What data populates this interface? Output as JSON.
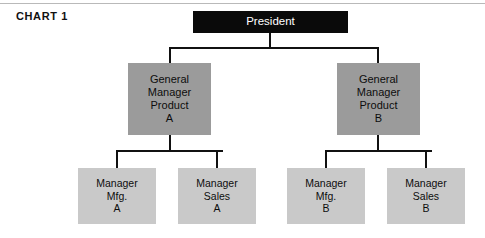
{
  "page": {
    "chart_label": "CHART 1",
    "background_color": "#ffffff"
  },
  "colors": {
    "president_fill": "#0a0a0a",
    "president_text": "#ffffff",
    "general_manager_fill": "#9b9b9b",
    "manager_fill": "#c9c9c9",
    "node_text": "#0d0d0d",
    "connector": "#111111"
  },
  "chart_data": {
    "type": "diagram",
    "title": "CHART 1",
    "subtype": "organizational-hierarchy",
    "levels": 3,
    "nodes": [
      {
        "id": "president",
        "level": 0,
        "lines": [
          "President"
        ],
        "fill": "#0a0a0a",
        "text_color": "#ffffff"
      },
      {
        "id": "gm-product-a",
        "level": 1,
        "lines": [
          "General",
          "Manager",
          "Product",
          "A"
        ],
        "fill": "#9b9b9b",
        "parent": "president"
      },
      {
        "id": "gm-product-b",
        "level": 1,
        "lines": [
          "General",
          "Manager",
          "Product",
          "B"
        ],
        "fill": "#9b9b9b",
        "parent": "president"
      },
      {
        "id": "mgr-mfg-a",
        "level": 2,
        "lines": [
          "Manager",
          "Mfg.",
          "A"
        ],
        "fill": "#c9c9c9",
        "parent": "gm-product-a"
      },
      {
        "id": "mgr-sales-a",
        "level": 2,
        "lines": [
          "Manager",
          "Sales",
          "A"
        ],
        "fill": "#c9c9c9",
        "parent": "gm-product-a"
      },
      {
        "id": "mgr-mfg-b",
        "level": 2,
        "lines": [
          "Manager",
          "Mfg.",
          "B"
        ],
        "fill": "#c9c9c9",
        "parent": "gm-product-b"
      },
      {
        "id": "mgr-sales-b",
        "level": 2,
        "lines": [
          "Manager",
          "Sales",
          "B"
        ],
        "fill": "#c9c9c9",
        "parent": "gm-product-b"
      }
    ],
    "edges": [
      {
        "from": "president",
        "to": "gm-product-a"
      },
      {
        "from": "president",
        "to": "gm-product-b"
      },
      {
        "from": "gm-product-a",
        "to": "mgr-mfg-a"
      },
      {
        "from": "gm-product-a",
        "to": "mgr-sales-a"
      },
      {
        "from": "gm-product-b",
        "to": "mgr-mfg-b"
      },
      {
        "from": "gm-product-b",
        "to": "mgr-sales-b"
      }
    ]
  },
  "nodes": {
    "president": {
      "line1": "President"
    },
    "gm_a": {
      "line1": "General",
      "line2": "Manager",
      "line3": "Product",
      "line4": "A"
    },
    "gm_b": {
      "line1": "General",
      "line2": "Manager",
      "line3": "Product",
      "line4": "B"
    },
    "mgr_mfg_a": {
      "line1": "Manager",
      "line2": "Mfg.",
      "line3": "A"
    },
    "mgr_sales_a": {
      "line1": "Manager",
      "line2": "Sales",
      "line3": "A"
    },
    "mgr_mfg_b": {
      "line1": "Manager",
      "line2": "Mfg.",
      "line3": "B"
    },
    "mgr_sales_b": {
      "line1": "Manager",
      "line2": "Sales",
      "line3": "B"
    }
  }
}
